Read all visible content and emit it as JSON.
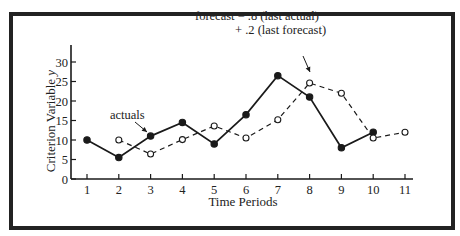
{
  "chart_data": {
    "type": "line",
    "title": "",
    "xlabel": "Time Periods",
    "ylabel": "Criterion Variable y",
    "x_ticks": [
      1,
      2,
      3,
      4,
      5,
      6,
      7,
      8,
      9,
      10,
      11
    ],
    "y_ticks": [
      0,
      5,
      10,
      15,
      20,
      25,
      30
    ],
    "xlim": [
      0.6,
      11.3
    ],
    "ylim": [
      0,
      34
    ],
    "grid": false,
    "series": [
      {
        "name": "actuals",
        "style": "solid line, filled circles",
        "x": [
          1,
          2,
          3,
          4,
          5,
          6,
          7,
          8,
          9,
          10
        ],
        "values": [
          10,
          5.5,
          11,
          14.5,
          9,
          16.5,
          26.5,
          21,
          8,
          12
        ]
      },
      {
        "name": "forecast",
        "style": "dashed line, open circles",
        "x": [
          2,
          3,
          4,
          5,
          6,
          7,
          8,
          9,
          10,
          11
        ],
        "values": [
          10,
          6.4,
          10.1,
          13.6,
          10.5,
          15.2,
          24.6,
          22,
          10.5,
          12
        ]
      }
    ],
    "annotations": [
      {
        "text": "actuals",
        "points_to": "actuals at period 3"
      },
      {
        "text": "forecast = .8 (last actual)",
        "line2": "+ .2 (last forecast)",
        "points_to": "forecast at period 8"
      }
    ]
  },
  "labels": {
    "ylabel_main": "Criterion Variable ",
    "ylabel_var": "y",
    "xlabel": "Time Periods",
    "actuals_annot": "actuals",
    "forecast_annot_line1": "forecast = .8 (last actual)",
    "forecast_annot_line2": "+ .2 (last forecast)"
  },
  "colors": {
    "ink": "#1a1a1a",
    "background": "#ffffff"
  }
}
